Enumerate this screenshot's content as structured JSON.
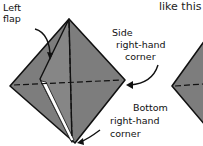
{
  "caption": "like this",
  "labels": {
    "left_flap_line1": "Left",
    "left_flap_line2": "flap",
    "side_line1": "Side",
    "side_line2": "right-hand",
    "side_line3": "corner",
    "bottom_line1": "Bottom",
    "bottom_line2": "right-hand",
    "bottom_line3": "corner"
  },
  "colors": {
    "paper": "#7a7a7a",
    "outline": "#111111",
    "background": "#ffffff"
  }
}
